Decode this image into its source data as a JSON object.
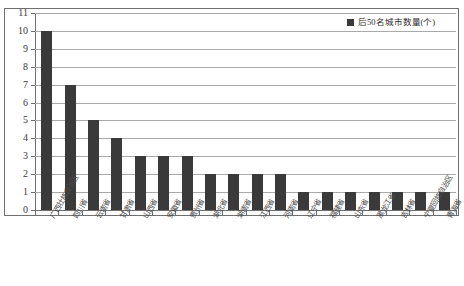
{
  "chart_data": {
    "type": "bar",
    "title": "",
    "xlabel": "",
    "ylabel": "",
    "ylim": [
      0,
      11
    ],
    "ytick_step": 1,
    "yticks": [
      11,
      10,
      9,
      8,
      7,
      6,
      5,
      4,
      3,
      2,
      1,
      0
    ],
    "grid": "horizontal",
    "legend_position": "top-right",
    "legend": [
      "后50名城市数量(个)"
    ],
    "series_color": "#3a3a3a",
    "categories": [
      "广西壮族自治区",
      "四川省",
      "云南省",
      "甘肃省",
      "山西省",
      "安徽省",
      "贵州省",
      "湖北省",
      "湖南省",
      "江西省",
      "河南省",
      "辽宁省",
      "福建省",
      "山东省",
      "黑龙江省",
      "吉林省",
      "宁夏回族自治区",
      "青海省"
    ],
    "series": [
      {
        "name": "后50名城市数量(个)",
        "values": [
          10,
          7,
          5,
          4,
          3,
          3,
          3,
          2,
          2,
          2,
          2,
          1,
          1,
          1,
          1,
          1,
          1,
          1
        ]
      }
    ],
    "values": [
      10,
      7,
      5,
      4,
      3,
      3,
      3,
      2,
      2,
      2,
      2,
      1,
      1,
      1,
      1,
      1,
      1,
      1
    ]
  },
  "legend": {
    "label": "后50名城市数量(个)",
    "swatch_color": "#3a3a3a"
  },
  "axes": {
    "y_max": 11,
    "y_min": 0
  }
}
